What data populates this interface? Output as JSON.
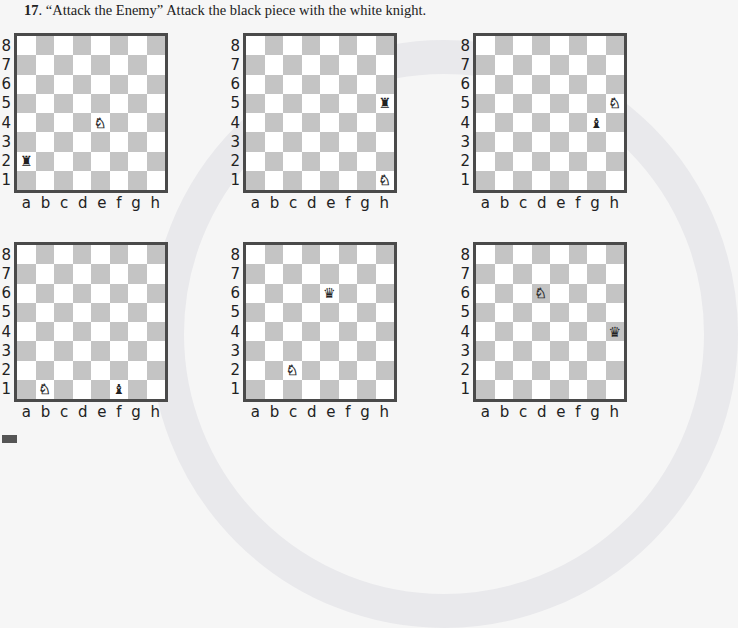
{
  "exercise": {
    "number": "17",
    "title_text": ". “Attack the Enemy” Attack the black piece with the white knight."
  },
  "labels": {
    "ranks": [
      "8",
      "7",
      "6",
      "5",
      "4",
      "3",
      "2",
      "1"
    ],
    "files": [
      "a",
      "b",
      "c",
      "d",
      "e",
      "f",
      "g",
      "h"
    ]
  },
  "colors": {
    "dark_square": "#c4c4c4",
    "light_square": "#ffffff",
    "border": "#4a4a4a"
  },
  "boards": [
    {
      "id": "board-1",
      "pieces": [
        {
          "square": "e4",
          "piece": "knight",
          "color": "white",
          "glyph": "♘"
        },
        {
          "square": "a2",
          "piece": "rook",
          "color": "black",
          "glyph": "♜"
        }
      ]
    },
    {
      "id": "board-2",
      "pieces": [
        {
          "square": "h1",
          "piece": "knight",
          "color": "white",
          "glyph": "♘"
        },
        {
          "square": "h5",
          "piece": "rook",
          "color": "black",
          "glyph": "♜"
        }
      ]
    },
    {
      "id": "board-3",
      "pieces": [
        {
          "square": "h5",
          "piece": "knight",
          "color": "white",
          "glyph": "♘"
        },
        {
          "square": "g4",
          "piece": "bishop",
          "color": "black",
          "glyph": "♝"
        }
      ]
    },
    {
      "id": "board-4",
      "pieces": [
        {
          "square": "b1",
          "piece": "knight",
          "color": "white",
          "glyph": "♘"
        },
        {
          "square": "f1",
          "piece": "bishop",
          "color": "black",
          "glyph": "♝"
        }
      ]
    },
    {
      "id": "board-5",
      "pieces": [
        {
          "square": "c2",
          "piece": "knight",
          "color": "white",
          "glyph": "♘"
        },
        {
          "square": "e6",
          "piece": "queen",
          "color": "black",
          "glyph": "♛"
        }
      ]
    },
    {
      "id": "board-6",
      "pieces": [
        {
          "square": "d6",
          "piece": "knight",
          "color": "white",
          "glyph": "♘"
        },
        {
          "square": "h4",
          "piece": "queen",
          "color": "black",
          "glyph": "♛"
        }
      ]
    }
  ]
}
